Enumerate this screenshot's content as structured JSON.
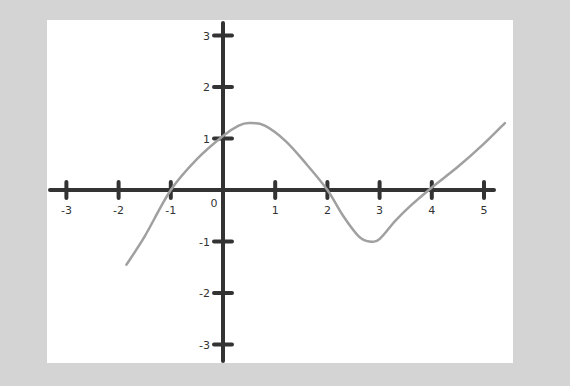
{
  "chart_data": {
    "type": "line",
    "title": "",
    "xlabel": "",
    "ylabel": "",
    "xlim": [
      -3.3,
      5.3
    ],
    "ylim": [
      -3.3,
      3.3
    ],
    "grid": false,
    "legend": null,
    "origin_label": "0",
    "x_ticks": [
      -3,
      -2,
      -1,
      1,
      2,
      3,
      4,
      5
    ],
    "x_tick_labels": [
      "-3",
      "-2",
      "-1",
      "1",
      "2",
      "3",
      "4",
      "5"
    ],
    "y_ticks": [
      3,
      2,
      1,
      -1,
      -2,
      -3
    ],
    "y_tick_labels": [
      "3",
      "2",
      "1",
      "-1",
      "-2",
      "-3"
    ],
    "series": [
      {
        "name": "curve",
        "color": "#a0a0a0",
        "x": [
          -1.85,
          -1.5,
          -1.0,
          -0.5,
          0.0,
          0.3,
          0.5,
          0.8,
          1.2,
          1.6,
          2.0,
          2.3,
          2.6,
          2.8,
          3.0,
          3.3,
          3.6,
          4.0,
          4.5,
          5.0,
          5.4
        ],
        "y": [
          -1.45,
          -0.9,
          0.0,
          0.6,
          1.05,
          1.25,
          1.3,
          1.25,
          0.95,
          0.5,
          0.0,
          -0.5,
          -0.9,
          -1.0,
          -0.95,
          -0.6,
          -0.3,
          0.05,
          0.45,
          0.9,
          1.3
        ]
      }
    ],
    "key_points": {
      "x_intercepts": [
        -1,
        2,
        4
      ],
      "y_intercept": 1.05,
      "local_max": [
        0.5,
        1.3
      ],
      "local_min": [
        2.8,
        -1.0
      ],
      "start": [
        -1.85,
        -1.45
      ],
      "end": [
        5.4,
        1.3
      ]
    }
  },
  "colors": {
    "background": "#d4d4d4",
    "panel": "#ffffff",
    "axis": "#333333",
    "curve": "#a0a0a0"
  }
}
